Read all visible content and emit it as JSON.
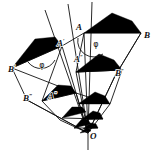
{
  "figure": {
    "background_color": "#ffffff",
    "ink_color": "#111111",
    "fill_color": "#000000",
    "center_label": "O",
    "angle_symbol": "φ",
    "labels": [
      {
        "name": "vertex-A",
        "base": "A",
        "primes": "",
        "x": 82,
        "y": 30,
        "anchor": "end"
      },
      {
        "name": "vertex-B",
        "base": "B",
        "primes": "",
        "x": 144,
        "y": 38,
        "anchor": "start"
      },
      {
        "name": "vertex-A1",
        "base": "A",
        "primes": "′",
        "x": 57,
        "y": 46,
        "anchor": "start"
      },
      {
        "name": "vertex-B1",
        "base": "B",
        "primes": "′",
        "x": 8,
        "y": 72,
        "anchor": "start"
      },
      {
        "name": "vertex-A2",
        "base": "A",
        "primes": "″",
        "x": 74,
        "y": 62,
        "anchor": "start"
      },
      {
        "name": "vertex-B2",
        "base": "B",
        "primes": "″",
        "x": 115,
        "y": 76,
        "anchor": "start"
      },
      {
        "name": "vertex-A3",
        "base": "A",
        "primes": "‴",
        "x": 48,
        "y": 99,
        "anchor": "start"
      },
      {
        "name": "vertex-B3",
        "base": "B",
        "primes": "‴",
        "x": 23,
        "y": 101,
        "anchor": "start"
      },
      {
        "name": "vertex-O",
        "base": "O",
        "primes": "",
        "x": 90,
        "y": 139,
        "anchor": "start"
      }
    ],
    "angles": [
      {
        "name": "angle-phi-at-A",
        "symbol": "φ",
        "x": 96,
        "y": 47
      },
      {
        "name": "angle-phi-at-A1",
        "symbol": "φ",
        "x": 42,
        "y": 68
      }
    ],
    "rays": [
      {
        "name": "ray-left",
        "x1": 45,
        "y1": 10,
        "x2": 88,
        "y2": 133
      },
      {
        "name": "ray-middle",
        "x1": 68,
        "y1": 4,
        "x2": 88,
        "y2": 133
      },
      {
        "name": "ray-right",
        "x1": 92,
        "y1": 2,
        "x2": 88,
        "y2": 133
      },
      {
        "name": "ray-axis",
        "x1": 88,
        "y1": 133,
        "x2": 88,
        "y2": 150
      }
    ],
    "triangles": [
      {
        "name": "triangle-0",
        "apex": [
          112,
          13
        ],
        "left": [
          84,
          33
        ],
        "right": [
          141,
          33
        ],
        "tail": [
          132,
          21
        ]
      },
      {
        "name": "triangle-1",
        "apex": [
          35,
          39
        ],
        "left": [
          12,
          68
        ],
        "right": [
          62,
          46
        ],
        "tail": [
          55,
          37
        ]
      },
      {
        "name": "triangle-2",
        "apex": [
          99,
          54
        ],
        "left": [
          76,
          72
        ],
        "right": [
          122,
          70
        ],
        "tail": [
          114,
          60
        ]
      },
      {
        "name": "triangle-3",
        "apex": [
          58,
          85
        ],
        "left": [
          42,
          101
        ],
        "right": [
          76,
          93
        ],
        "tail": [
          71,
          86
        ]
      },
      {
        "name": "triangle-4",
        "apex": [
          95,
          92
        ],
        "left": [
          78,
          104
        ],
        "right": [
          110,
          104
        ],
        "tail": [
          105,
          96
        ]
      },
      {
        "name": "triangle-5",
        "apex": [
          72,
          107
        ],
        "left": [
          62,
          118
        ],
        "right": [
          86,
          112
        ],
        "tail": [
          82,
          107
        ]
      },
      {
        "name": "triangle-6",
        "apex": [
          93,
          111
        ],
        "left": [
          81,
          120
        ],
        "right": [
          103,
          119
        ],
        "tail": [
          100,
          113
        ]
      },
      {
        "name": "triangle-7",
        "apex": [
          81,
          120
        ],
        "left": [
          74,
          128
        ],
        "right": [
          91,
          124
        ],
        "tail": [
          88,
          120
        ]
      },
      {
        "name": "triangle-8",
        "apex": [
          91,
          123
        ],
        "left": [
          83,
          129
        ],
        "right": [
          98,
          128
        ],
        "tail": [
          96,
          124
        ]
      },
      {
        "name": "triangle-9",
        "apex": [
          85,
          129
        ],
        "left": [
          80,
          133
        ],
        "right": [
          91,
          131
        ],
        "tail": [
          89,
          129
        ]
      }
    ],
    "quads": [
      {
        "name": "quad-outer-right",
        "points": "84,33 141,33 115,76 88,133"
      },
      {
        "name": "quad-outer-left",
        "points": "62,46 12,68 27,100 88,133"
      },
      {
        "name": "quad-mid-right",
        "points": "76,72 122,70 110,104 88,133"
      },
      {
        "name": "quad-mid-left",
        "points": "76,93 42,101 60,120 88,133"
      }
    ],
    "connectors": [
      {
        "name": "conn-A-A1",
        "x1": 84,
        "y1": 33,
        "x2": 62,
        "y2": 46
      },
      {
        "name": "conn-A1-A3",
        "x1": 62,
        "y1": 46,
        "x2": 42,
        "y2": 101
      },
      {
        "name": "conn-A-A2",
        "x1": 84,
        "y1": 33,
        "x2": 76,
        "y2": 72
      },
      {
        "name": "conn-B1-A3",
        "x1": 12,
        "y1": 68,
        "x2": 76,
        "y2": 93
      },
      {
        "name": "conn-B-B2",
        "x1": 141,
        "y1": 33,
        "x2": 115,
        "y2": 76
      },
      {
        "name": "conn-A2-B2",
        "x1": 76,
        "y1": 72,
        "x2": 122,
        "y2": 70
      },
      {
        "name": "conn-A3-mid",
        "x1": 76,
        "y1": 93,
        "x2": 110,
        "y2": 104
      },
      {
        "name": "conn-sm-1",
        "x1": 62,
        "y1": 118,
        "x2": 103,
        "y2": 119
      },
      {
        "name": "conn-sm-2",
        "x1": 74,
        "y1": 128,
        "x2": 98,
        "y2": 128
      },
      {
        "name": "conn-O-left",
        "x1": 88,
        "y1": 133,
        "x2": 27,
        "y2": 100
      },
      {
        "name": "conn-O-B2",
        "x1": 88,
        "y1": 133,
        "x2": 115,
        "y2": 76
      }
    ]
  }
}
